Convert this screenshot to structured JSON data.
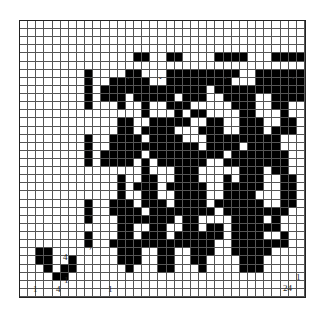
{
  "diagram": {
    "type": "weave-draft",
    "columns": 35,
    "rows": 34,
    "rows_bitmap": [
      "...................................",
      "...................................",
      "...................................",
      "...................................",
      "..............XX..XX....XXXX...XXXX",
      "...................................",
      "........X....XX...XXXXXXXXX..XXXXXX",
      "........X..XXXXX..XXXXXXXX...XXXXXX",
      "........X.XXXXXXXXXXXXX.XXXXXXXXXXX",
      "........X.XXX.XXXXX.XXX..XXXX..XXXX",
      "........X...X..X..XXX.....XXX..XX..",
      "...............X...X.XX....XX...X..",
      "............XX..XXXXX..XX..XXX..XX.",
      "............XX.XXXX...XXX..XXX.XXX.",
      "........X..XXXX.XXXX...XXXXXXXXX...",
      "........X..XXXXXXXXXXX.XXXX.XXXX...",
      "........X.XXXXX.XXXXXXXXX.XXXXXXX..",
      "........X.XXXX.X.XXXXXX..XXXXXXXX..",
      "...............X...XXX.....XXX.XX..",
      "............X..XX..XXX...X.XXX..XX.",
      "............X.XXX.XXXXX..XXXXX..XX.",
      "............X..XX..XXXX..XXXX...XX.",
      "........X..XXX.XXX.XXXX.XXXXXX..XX.",
      "........X..XXXX.XXXXXXXX.XXXXXXXX..",
      "........X...XXXXXXX.XX....XXXX.X...",
      "............XX..XX..XX.XX.XXXXXX...",
      "........X...XX.XXX.XXXXXX.XXXX..X..",
      "........X..XXXXXXXXXXXXX..XXXXXXX..",
      "..XX........XXX..XX..XXX..XXXXX....",
      "..XX..X.....XXX..XX..XX....XXX.....",
      "...X.XX......X...XX...X....XXX.....",
      "....XX.............................",
      "...................................",
      "..................................."
    ],
    "labels": [
      {
        "text": "1",
        "pos": "bottom-left"
      },
      {
        "text": "4",
        "pos": "bottom-left-4"
      },
      {
        "text": "4",
        "pos": "left-side-4"
      },
      {
        "text": "1",
        "pos": "left-side-1"
      },
      {
        "text": "1",
        "pos": "bottom-main-1"
      },
      {
        "text": "1",
        "pos": "right-side-1"
      },
      {
        "text": "24",
        "pos": "bottom-right-24"
      }
    ],
    "markers": [
      "arrow-right",
      "arrow-down",
      "arrow-down",
      "arrow-down",
      "arrow-down",
      "arrow-right",
      "arrow-right",
      "arrow-right"
    ]
  }
}
